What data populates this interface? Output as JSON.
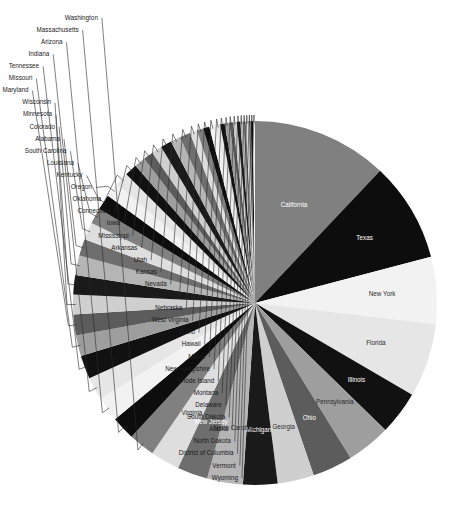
{
  "chart_data": {
    "type": "pie",
    "title": "",
    "subtitle": "",
    "legend_position": "none",
    "grid": false,
    "start_angle_deg": 0,
    "direction": "clockwise",
    "label_placement": "inside-large-outside-small",
    "palette": [
      "#808080",
      "#0d0d0d",
      "#f2f2f2",
      "#e6e6e6",
      "#111111",
      "#9e9e9e",
      "#5c5c5c",
      "#cfcfcf",
      "#1a1a1a",
      "#b5b5b5",
      "#6e6e6e",
      "#dedede"
    ],
    "categories": [
      "California",
      "Texas",
      "New York",
      "Florida",
      "Illinois",
      "Pennsylvania",
      "Ohio",
      "Georgia",
      "Michigan",
      "North Carolina",
      "New Jersey",
      "Virginia",
      "Washington",
      "Massachusetts",
      "Arizona",
      "Indiana",
      "Tennessee",
      "Missouri",
      "Maryland",
      "Wisconsin",
      "Minnesota",
      "Colorado",
      "Alabama",
      "South Carolina",
      "Louisiana",
      "Kentucky",
      "Oregon",
      "Oklahoma",
      "Connecticut",
      "Iowa",
      "Mississippi",
      "Arkansas",
      "Utah",
      "Kansas",
      "Nevada",
      "New Mexico",
      "Nebraska",
      "West Virginia",
      "Idaho",
      "Hawaii",
      "Maine",
      "New Hampshire",
      "Rhode Island",
      "Montana",
      "Delaware",
      "South Dakota",
      "Alaska",
      "North Dakota",
      "District of Columbia",
      "Vermont",
      "Wyoming"
    ],
    "values": [
      39.5,
      29.0,
      19.5,
      21.5,
      12.7,
      12.8,
      11.7,
      10.6,
      10.0,
      10.4,
      8.9,
      8.5,
      7.6,
      6.9,
      7.2,
      6.7,
      6.8,
      6.1,
      6.0,
      5.8,
      5.6,
      5.7,
      4.9,
      5.1,
      4.6,
      4.5,
      4.2,
      3.9,
      3.6,
      3.2,
      2.9,
      3.0,
      3.2,
      2.9,
      3.1,
      2.1,
      1.9,
      1.8,
      1.8,
      1.4,
      1.3,
      1.3,
      1.1,
      1.1,
      0.97,
      0.88,
      0.73,
      0.76,
      0.7,
      0.62,
      0.58
    ],
    "inside_labeled": [
      "California",
      "Texas",
      "New York",
      "Florida",
      "Illinois",
      "Pennsylvania",
      "Ohio",
      "Georgia",
      "Michigan",
      "North Carolina",
      "New Jersey",
      "Virginia"
    ],
    "outside_labeled": [
      "Washington",
      "Massachusetts",
      "Arizona",
      "Indiana",
      "Tennessee",
      "Missouri",
      "Maryland",
      "Wisconsin",
      "Minnesota",
      "Colorado",
      "Alabama",
      "South Carolina",
      "Louisiana",
      "Kentucky",
      "Oregon",
      "Oklahoma",
      "Connecticut",
      "Iowa",
      "Mississippi",
      "Arkansas",
      "Utah",
      "Kansas",
      "Nevada",
      "New Mexico",
      "Nebraska",
      "West Virginia",
      "Idaho",
      "Hawaii",
      "Maine",
      "New Hampshire",
      "Rhode Island",
      "Montana",
      "Delaware",
      "South Dakota",
      "Alaska",
      "North Dakota",
      "District of Columbia",
      "Vermont",
      "Wyoming"
    ],
    "xlabel": "",
    "ylabel": ""
  },
  "geometry": {
    "center_x": 255,
    "center_y": 303,
    "radius": 182
  }
}
